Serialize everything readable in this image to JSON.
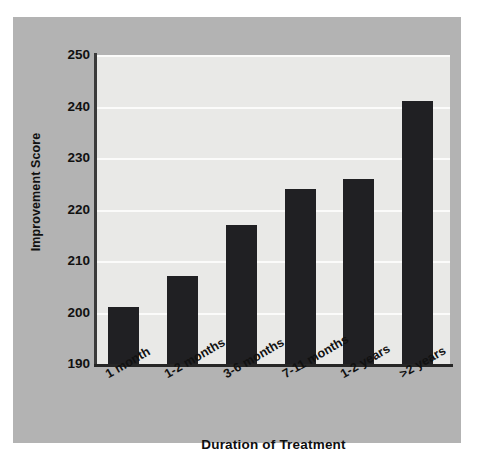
{
  "chart_data": {
    "type": "bar",
    "title": "",
    "subtitle": "",
    "xlabel": "Duration of Treatment",
    "ylabel": "Improvement Score",
    "categories": [
      "1 month",
      "1-2 months",
      "3-6 months",
      "7-11 months",
      "1-2 years",
      ">2 years"
    ],
    "values": [
      201,
      207,
      217,
      224,
      226,
      241
    ],
    "ylim": [
      190,
      250
    ],
    "yticks": [
      190,
      200,
      210,
      220,
      230,
      240,
      250
    ],
    "ytick_labels": [
      "190",
      "200",
      "210",
      "220",
      "230",
      "240",
      "250"
    ],
    "grid": "horizontal",
    "legend": "none",
    "series": [
      {
        "name": "Improvement Score",
        "values": [
          201,
          207,
          217,
          224,
          226,
          241
        ]
      }
    ],
    "colors": {
      "bar": "#202023",
      "plot_background": "#e9e9e7",
      "panel_background": "#b3b3b3",
      "gridline": "#fbfbfa",
      "axis": "#262626",
      "text": "#111111"
    }
  }
}
